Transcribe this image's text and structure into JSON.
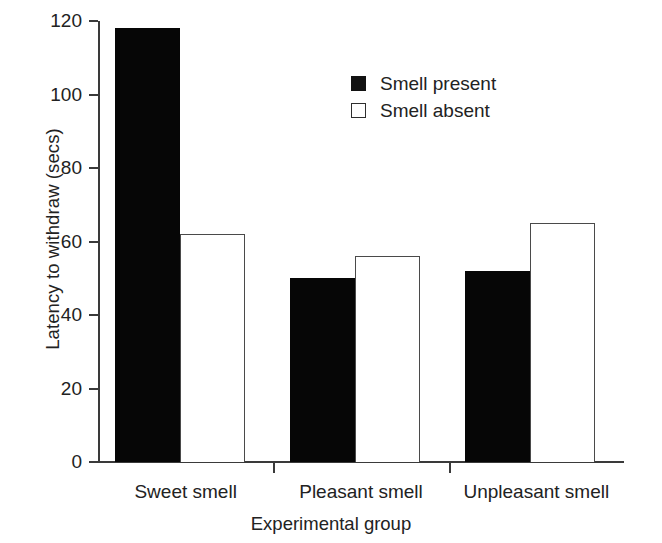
{
  "chart_data": {
    "type": "bar",
    "title": "",
    "xlabel": "Experimental group",
    "ylabel": "Latency to withdraw (secs)",
    "categories": [
      "Sweet smell",
      "Pleasant smell",
      "Unpleasant smell"
    ],
    "series": [
      {
        "name": "Smell present",
        "values": [
          118,
          50,
          52
        ],
        "color": "#060606",
        "style": "filled"
      },
      {
        "name": "Smell absent",
        "values": [
          62,
          56,
          65
        ],
        "color": "#ffffff",
        "style": "open"
      }
    ],
    "ylim": [
      0,
      120
    ],
    "yticks": [
      0,
      20,
      40,
      60,
      80,
      100,
      120
    ],
    "ytick_labels": [
      "0",
      "20",
      "40",
      "60",
      "80",
      "100",
      "120"
    ],
    "grid": false,
    "legend_position": "upper-center-right"
  },
  "legend": {
    "items": [
      {
        "label": "Smell present",
        "swatch": "filled-square-icon"
      },
      {
        "label": "Smell absent",
        "swatch": "open-square-icon"
      }
    ]
  },
  "axes": {
    "y_title": "Latency to withdraw (secs)",
    "x_title": "Experimental group"
  }
}
